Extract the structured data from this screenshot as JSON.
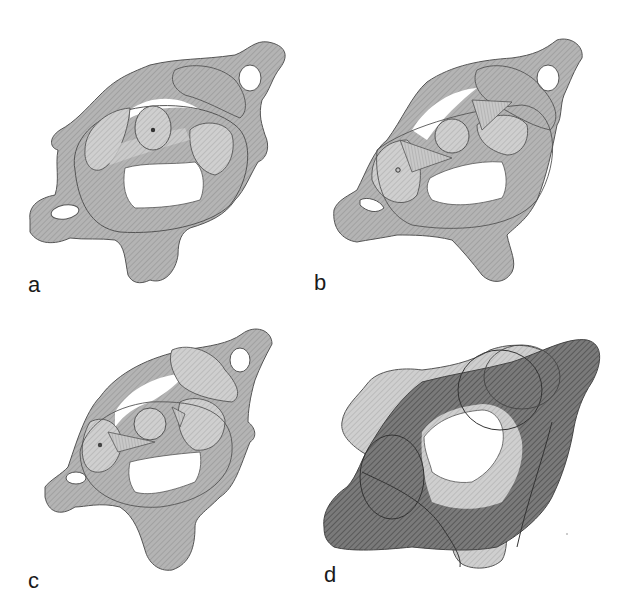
{
  "figure": {
    "colors": {
      "bone_fill": "#a8a8a8",
      "bone_light": "#c4c4c4",
      "bone_dark": "#5a5a5a",
      "outline": "#444444",
      "background": "#ffffff"
    },
    "panels": [
      {
        "id": "a",
        "label": "a",
        "content": "superimposed vertebrae, dens centered with pivot dot"
      },
      {
        "id": "b",
        "label": "b",
        "content": "rotated position, fan-shaped ligament, pivot dot left"
      },
      {
        "id": "c",
        "label": "c",
        "content": "further rotated position, fan-shaped ligament, pivot dot left"
      },
      {
        "id": "d",
        "label": "d",
        "content": "schematic overlay: dark hatched and light hatched outlines"
      }
    ]
  }
}
